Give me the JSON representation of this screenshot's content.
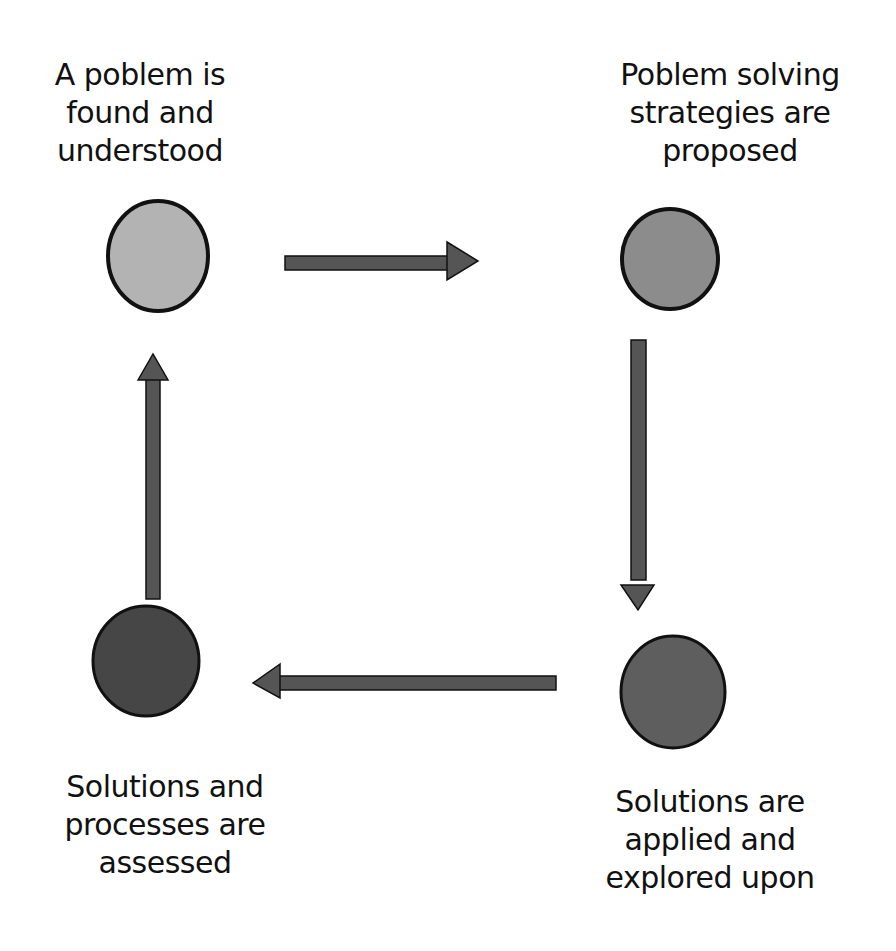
{
  "diagram": {
    "type": "cycle",
    "nodes": [
      {
        "id": "n1",
        "label": "A poblem is\nfound and\nunderstood",
        "color": "#b3b3b3"
      },
      {
        "id": "n2",
        "label": "Poblem solving\nstrategies are\nproposed",
        "color": "#8c8c8c"
      },
      {
        "id": "n3",
        "label": "Solutions are\napplied and\nexplored upon",
        "color": "#5e5e5e"
      },
      {
        "id": "n4",
        "label": "Solutions and\nprocesses are\nassessed",
        "color": "#464646"
      }
    ],
    "edges": [
      {
        "from": "n1",
        "to": "n2",
        "direction": "right"
      },
      {
        "from": "n2",
        "to": "n3",
        "direction": "down"
      },
      {
        "from": "n3",
        "to": "n4",
        "direction": "left"
      },
      {
        "from": "n4",
        "to": "n1",
        "direction": "up"
      }
    ],
    "arrow_color": "#555555"
  }
}
